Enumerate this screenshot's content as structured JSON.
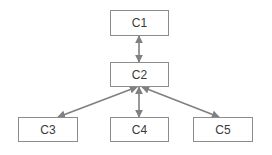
{
  "diagram": {
    "title": "",
    "background_color": "#ffffff",
    "node_border_color": "#8c8c8c",
    "node_fill_color": "#ffffff",
    "edge_color": "#808080",
    "label_color": "#3a3a3a",
    "nodes": [
      {
        "id": "c1",
        "label": "C1",
        "x": 110,
        "y": 10,
        "width": 59,
        "height": 26
      },
      {
        "id": "c2",
        "label": "C2",
        "x": 110,
        "y": 62,
        "width": 59,
        "height": 25
      },
      {
        "id": "c3",
        "label": "C3",
        "x": 18,
        "y": 117,
        "width": 60,
        "height": 25
      },
      {
        "id": "c4",
        "label": "C4",
        "x": 110,
        "y": 117,
        "width": 59,
        "height": 25
      },
      {
        "id": "c5",
        "label": "C5",
        "x": 193,
        "y": 117,
        "width": 60,
        "height": 25
      }
    ],
    "edges": [
      {
        "id": "c1-c2",
        "from": "c1",
        "to": "c2",
        "label": "",
        "arrowheads": "both",
        "x1": 139,
        "y1": 36,
        "x2": 139,
        "y2": 62
      },
      {
        "id": "c2-c3",
        "from": "c2",
        "to": "c3",
        "label": "",
        "arrowheads": "both",
        "x1": 137,
        "y1": 87,
        "x2": 58,
        "y2": 117
      },
      {
        "id": "c2-c4",
        "from": "c2",
        "to": "c4",
        "label": "",
        "arrowheads": "both",
        "x1": 139,
        "y1": 87,
        "x2": 139,
        "y2": 117
      },
      {
        "id": "c2-c5",
        "from": "c2",
        "to": "c5",
        "label": "",
        "arrowheads": "both",
        "x1": 142,
        "y1": 87,
        "x2": 219,
        "y2": 117
      }
    ]
  }
}
